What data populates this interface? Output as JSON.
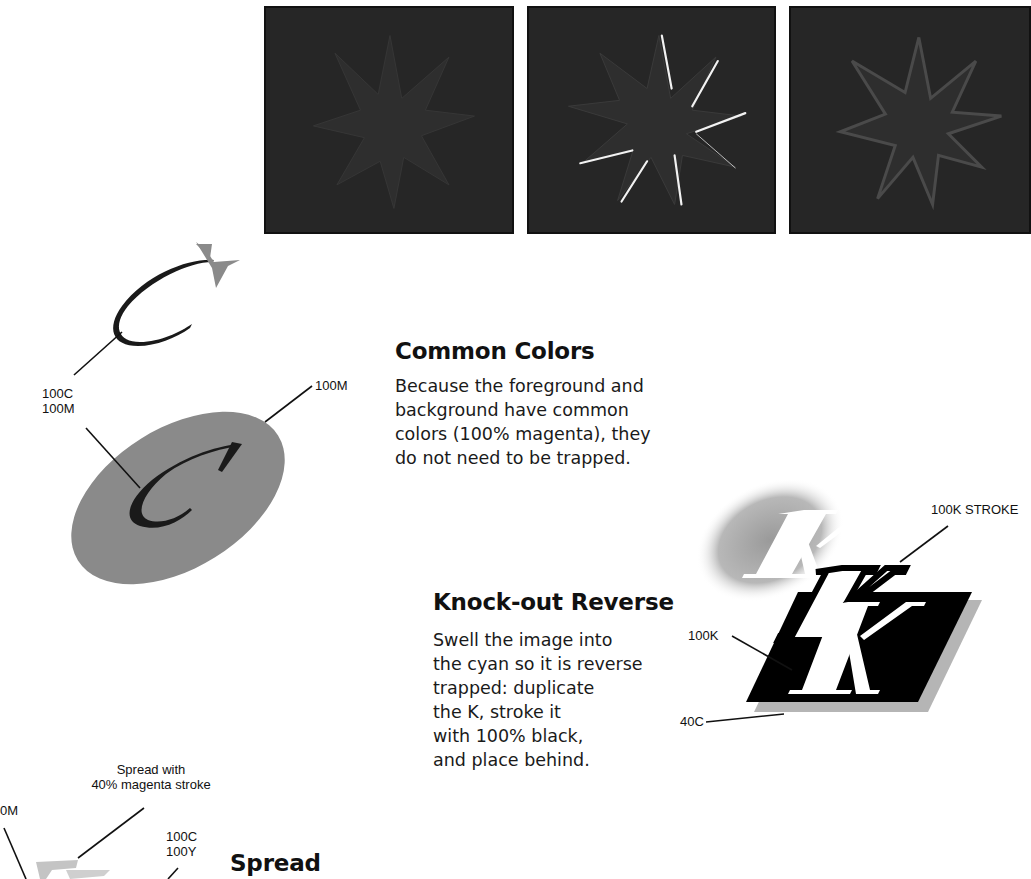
{
  "panels": [
    {
      "id": "star-panel-1",
      "description": "dark star on dark background, no trap"
    },
    {
      "id": "star-panel-2",
      "description": "dark star with white gap lines (misregistration)"
    },
    {
      "id": "star-panel-3",
      "description": "dark star with trapped outline"
    }
  ],
  "sections": {
    "common_colors": {
      "heading": "Common Colors",
      "body": "Because the foreground and\nbackground have common\ncolors (100% magenta), they\ndo not need to be trapped."
    },
    "knockout_reverse": {
      "heading": "Knock-out Reverse",
      "body": "Swell the image into\nthe cyan so it is reverse\ntrapped: duplicate\nthe K, stroke it\nwith 100% black,\nand place behind."
    },
    "spread": {
      "heading": "Spread"
    }
  },
  "labels": {
    "c_label": "100C\n100M",
    "m_label": "100M",
    "k_stroke": "100K STROKE",
    "k_100": "100K",
    "c_40": "40C",
    "spread_stroke": "Spread with\n40% magenta stroke",
    "cy_label": "100C\n100Y",
    "m_edge": "0M"
  },
  "colors": {
    "panel_bg": "#262626",
    "star_fill": "#303030",
    "ellipse_gray": "#8a8a8a",
    "c_glyph": "#1a1a1a",
    "shadow_gray": "#b5b5b5"
  }
}
